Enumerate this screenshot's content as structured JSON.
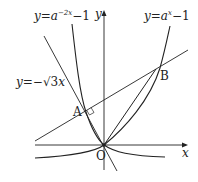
{
  "diagram": {
    "curves": [
      {
        "id": "curve-a-neg2x",
        "label_y": "y",
        "label_eq": "=",
        "label_a": "a",
        "label_exp": "−2x",
        "label_rest": "−1"
      },
      {
        "id": "curve-a-x",
        "label_y": "y",
        "label_eq": "=",
        "label_a": "a",
        "label_exp": "x",
        "label_rest": "−1"
      }
    ],
    "line_label": {
      "y": "y",
      "eq": "=−",
      "sqrt": "√3",
      "x": "x"
    },
    "axes": {
      "x_label": "x",
      "y_label": "y",
      "origin_label": "O"
    },
    "points": {
      "A": "A",
      "B": "B"
    },
    "colors": {
      "stroke": "#222222",
      "background": "#ffffff"
    }
  }
}
